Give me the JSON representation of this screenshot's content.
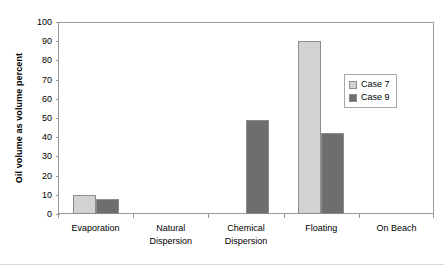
{
  "chart_data": {
    "type": "bar",
    "title": "",
    "xlabel": "",
    "ylabel": "Oil volume as volume percent",
    "ylim": [
      0,
      100
    ],
    "ytick_step": 10,
    "yticks": [
      100,
      90,
      80,
      70,
      60,
      50,
      40,
      30,
      20,
      10,
      0
    ],
    "grid": false,
    "legend_position": "center-right",
    "categories": [
      "Evaporation",
      "Natural Dispersion",
      "Chemical Dispersion",
      "Floating",
      "On Beach"
    ],
    "category_lines": [
      [
        "Evaporation"
      ],
      [
        "Natural",
        "Dispersion"
      ],
      [
        "Chemical",
        "Dispersion"
      ],
      [
        "Floating"
      ],
      [
        "On Beach"
      ]
    ],
    "series": [
      {
        "name": "Case 7",
        "color": "#d2d2d2",
        "values": [
          10,
          0,
          0,
          90,
          0
        ]
      },
      {
        "name": "Case 9",
        "color": "#6e6e6e",
        "values": [
          8,
          0,
          49,
          42,
          0
        ]
      }
    ]
  },
  "legend": {
    "entries": [
      {
        "label": "Case 7",
        "color": "#d2d2d2"
      },
      {
        "label": "Case 9",
        "color": "#6e6e6e"
      }
    ]
  },
  "axes": {
    "y_title": "Oil volume as volume percent"
  }
}
